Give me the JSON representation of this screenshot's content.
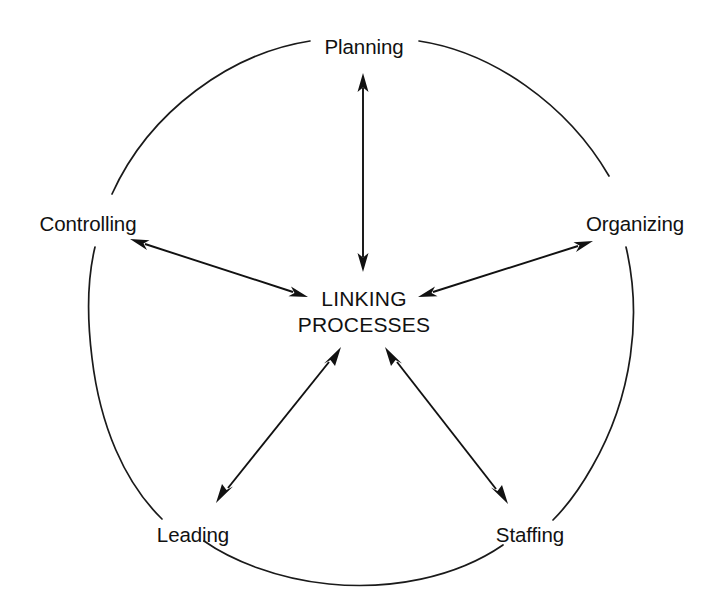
{
  "diagram": {
    "type": "cycle-hub-diagram",
    "colors": {
      "background": "#ffffff",
      "stroke": "#111111",
      "text": "#111111"
    },
    "center": {
      "line1": "LINKING",
      "line2": "PROCESSES"
    },
    "nodes": [
      {
        "id": "planning",
        "label": "Planning",
        "position": "top"
      },
      {
        "id": "organizing",
        "label": "Organizing",
        "position": "upper-right"
      },
      {
        "id": "staffing",
        "label": "Staffing",
        "position": "lower-right"
      },
      {
        "id": "leading",
        "label": "Leading",
        "position": "lower-left"
      },
      {
        "id": "controlling",
        "label": "Controlling",
        "position": "upper-left"
      }
    ],
    "connectors": [
      {
        "id": "planning-link",
        "from": "planning",
        "to": "center",
        "style": "double-headed"
      },
      {
        "id": "organizing-link",
        "from": "organizing",
        "to": "center",
        "style": "double-headed"
      },
      {
        "id": "staffing-link",
        "from": "staffing",
        "to": "center",
        "style": "double-headed"
      },
      {
        "id": "leading-link",
        "from": "leading",
        "to": "center",
        "style": "double-headed"
      },
      {
        "id": "controlling-link",
        "from": "controlling",
        "to": "center",
        "style": "double-headed"
      }
    ]
  }
}
